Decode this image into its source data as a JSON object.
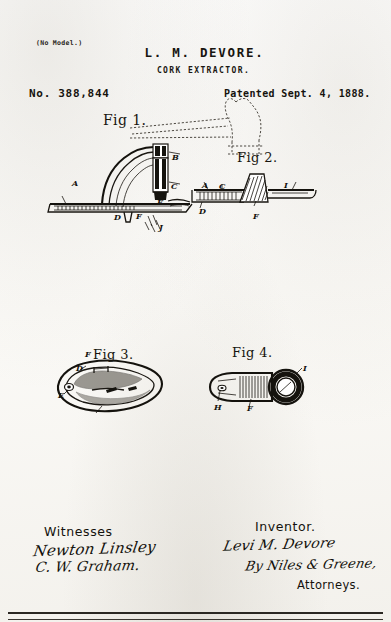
{
  "document": {
    "type": "patent-drawing-sheet",
    "model_note": "(No Model.)",
    "inventor_name_header": "L. M. DEVORE.",
    "subject": "CORK EXTRACTOR.",
    "patent_number": "No. 388,844",
    "patent_date": "Patented Sept. 4, 1888."
  },
  "figures": [
    {
      "id": "fig1",
      "caption": "Fig 1.",
      "description": "Side elevation of cork extractor mounted on bottle neck, with bottle shown in dotted outline",
      "reference_letters": [
        "A",
        "B",
        "C",
        "D",
        "E",
        "F",
        "J"
      ]
    },
    {
      "id": "fig2",
      "caption": "Fig 2.",
      "description": "Longitudinal sectional view of the extractor lever",
      "reference_letters": [
        "A",
        "C",
        "D",
        "F",
        "I"
      ]
    },
    {
      "id": "fig3",
      "caption": "Fig 3.",
      "description": "Plan view of the base plate",
      "reference_letters": [
        "D",
        "E",
        "F"
      ]
    },
    {
      "id": "fig4",
      "caption": "Fig 4.",
      "description": "Detail view of the ring and shank",
      "reference_letters": [
        "F",
        "H",
        "I"
      ]
    }
  ],
  "fig1_refs": [
    {
      "letter": "A",
      "x": 72,
      "y": 178
    },
    {
      "letter": "B",
      "x": 172,
      "y": 158
    },
    {
      "letter": "C",
      "x": 171,
      "y": 180
    },
    {
      "letter": "D",
      "x": 114,
      "y": 212
    },
    {
      "letter": "E",
      "x": 157,
      "y": 199
    },
    {
      "letter": "F",
      "x": 136,
      "y": 211
    },
    {
      "letter": "J",
      "x": 158,
      "y": 222
    }
  ],
  "fig2_refs": [
    {
      "letter": "A",
      "x": 204,
      "y": 184
    },
    {
      "letter": "C",
      "x": 220,
      "y": 184
    },
    {
      "letter": "I",
      "x": 283,
      "y": 184
    },
    {
      "letter": "D",
      "x": 204,
      "y": 210
    },
    {
      "letter": "F",
      "x": 253,
      "y": 213
    }
  ],
  "fig3_refs": [
    {
      "letter": "D",
      "x": 76,
      "y": 365
    },
    {
      "letter": "E",
      "x": 61,
      "y": 392
    },
    {
      "letter": "F",
      "x": 88,
      "y": 352
    }
  ],
  "fig4_refs": [
    {
      "letter": "I",
      "x": 297,
      "y": 368
    },
    {
      "letter": "H",
      "x": 215,
      "y": 404
    },
    {
      "letter": "F",
      "x": 248,
      "y": 404
    }
  ],
  "signatures": {
    "witnesses_heading": "Witnesses",
    "witness_1": "Newton Linsley",
    "witness_2": "C. W. Graham.",
    "inventor_heading": "Inventor.",
    "inventor_signature": "Levi M. Devore",
    "attorney_signature": "By Niles & Greene,",
    "attorneys_label": "Attorneys."
  },
  "colors": {
    "ink": "#1a1712",
    "paper": "#fdfdfc",
    "rule": "#2a2722"
  }
}
